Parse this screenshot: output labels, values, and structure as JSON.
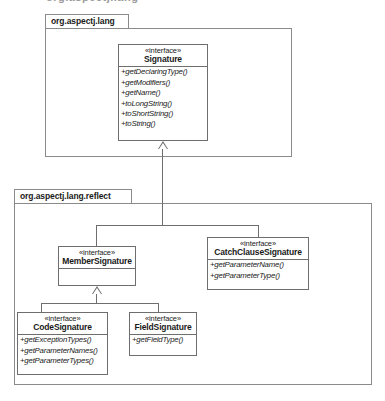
{
  "diagram": {
    "type": "uml-class-diagram",
    "title_fragment": "org.aspectj.lang",
    "packages": [
      {
        "id": "lang",
        "name": "org.aspectj.lang"
      },
      {
        "id": "reflect",
        "name": "org.aspectj.lang.reflect"
      }
    ],
    "classes": [
      {
        "id": "signature",
        "stereotype": "«interface»",
        "name": "Signature",
        "operations": [
          "+getDeclaringType()",
          "+getModifiers()",
          "+getName()",
          "+toLongString()",
          "+toShortString()",
          "+toString()"
        ]
      },
      {
        "id": "member_signature",
        "stereotype": "«interface»",
        "name": "MemberSignature",
        "operations": []
      },
      {
        "id": "catch_clause_signature",
        "stereotype": "«interface»",
        "name": "CatchClauseSignature",
        "operations": [
          "+getParameterName()",
          "+getParameterType()"
        ]
      },
      {
        "id": "code_signature",
        "stereotype": "«interface»",
        "name": "CodeSignature",
        "operations": [
          "+getExceptionTypes()",
          "+getParameterNames()",
          "+getParameterTypes()"
        ]
      },
      {
        "id": "field_signature",
        "stereotype": "«interface»",
        "name": "FieldSignature",
        "operations": [
          "+getFieldType()"
        ]
      }
    ],
    "relationships": [
      {
        "type": "generalization",
        "from": "MemberSignature",
        "to": "Signature"
      },
      {
        "type": "generalization",
        "from": "CatchClauseSignature",
        "to": "Signature"
      },
      {
        "type": "generalization",
        "from": "CodeSignature",
        "to": "MemberSignature"
      },
      {
        "type": "generalization",
        "from": "FieldSignature",
        "to": "MemberSignature"
      }
    ],
    "colors": {
      "background": "#ffffff",
      "line": "#6e6e6e",
      "package_line": "#8a8a8a",
      "text": "#1a1a1a"
    }
  }
}
